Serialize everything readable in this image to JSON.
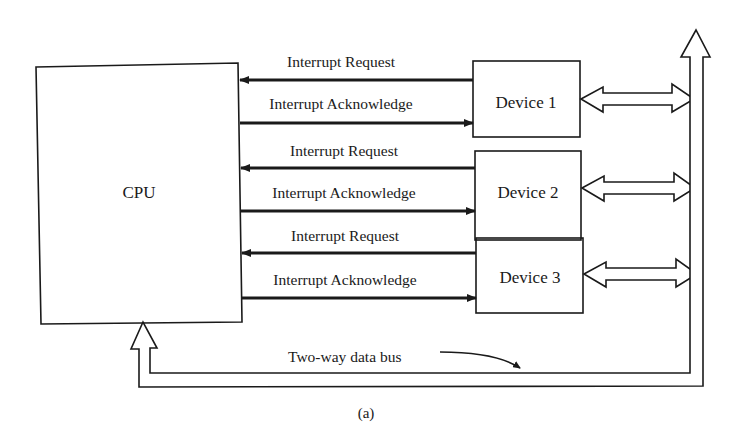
{
  "diagram": {
    "caption": "(a)",
    "cpu": {
      "label": "CPU"
    },
    "devices": [
      {
        "label": "Device 1",
        "request_label": "Interrupt Request",
        "ack_label": "Interrupt Acknowledge"
      },
      {
        "label": "Device 2",
        "request_label": "Interrupt Request",
        "ack_label": "Interrupt Acknowledge"
      },
      {
        "label": "Device 3",
        "request_label": "Interrupt Request",
        "ack_label": "Interrupt Acknowledge"
      }
    ],
    "bus": {
      "label": "Two-way data bus"
    },
    "colors": {
      "line": "#1a1a1a",
      "background": "#ffffff"
    }
  }
}
